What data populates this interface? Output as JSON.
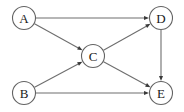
{
  "diagram": {
    "type": "directed-graph",
    "title": "",
    "background_color": "#ffffff",
    "node_stroke_color": "#636363",
    "node_fill_color": "#ffffff",
    "edge_color": "#6e6e6e",
    "arrow_color": "#3a3a3a",
    "label_color": "#1a1a1a",
    "node_radius": 11.5,
    "nodes": [
      {
        "id": "A",
        "label": "A",
        "x": 24,
        "y": 18
      },
      {
        "id": "B",
        "label": "B",
        "x": 24,
        "y": 93
      },
      {
        "id": "C",
        "label": "C",
        "x": 93,
        "y": 56
      },
      {
        "id": "D",
        "label": "D",
        "x": 161,
        "y": 18
      },
      {
        "id": "E",
        "label": "E",
        "x": 161,
        "y": 93
      }
    ],
    "edges": [
      {
        "from": "A",
        "to": "D",
        "directed": true
      },
      {
        "from": "A",
        "to": "C",
        "directed": true
      },
      {
        "from": "B",
        "to": "C",
        "directed": true
      },
      {
        "from": "B",
        "to": "E",
        "directed": true
      },
      {
        "from": "C",
        "to": "D",
        "directed": true
      },
      {
        "from": "C",
        "to": "E",
        "directed": true
      },
      {
        "from": "D",
        "to": "E",
        "directed": true
      }
    ]
  }
}
